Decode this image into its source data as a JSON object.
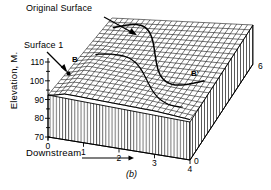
{
  "figure": {
    "caption": "(b)",
    "annotations": {
      "original_surface": "Original Surface",
      "surface_1": "Surface 1",
      "section_start": "B",
      "section_end": "B'"
    }
  },
  "axes": {
    "y": {
      "label": "Elevation, M.",
      "ticks": [
        "110",
        "100",
        "90",
        "80",
        "70"
      ],
      "min": 70,
      "max": 110
    },
    "x": {
      "label": "Downstream",
      "ticks": [
        "0",
        "1",
        "2",
        "3",
        "4"
      ],
      "min": 0,
      "max": 4
    },
    "z": {
      "ticks": [
        "0",
        "6"
      ],
      "min": 0,
      "max": 6
    }
  },
  "chart_data": {
    "type": "surface",
    "title": "",
    "xlabel": "Downstream",
    "ylabel": "Elevation, M.",
    "zlabel": "",
    "xlim": [
      0,
      4
    ],
    "ylim": [
      70,
      110
    ],
    "zlim": [
      0,
      6
    ],
    "grid": true,
    "legend_position": "none",
    "mesh": {
      "nx": 26,
      "nz": 20,
      "x_range": [
        0,
        4
      ],
      "z_range": [
        0,
        6
      ],
      "elevation_base": 70,
      "flat_plane_elevation": 103,
      "dune_amplitude": 6.5,
      "dune_wavelength_x": 1.1,
      "dune_wavelength_z": 1.6
    },
    "series": [
      {
        "name": "Original Surface",
        "kind": "plane",
        "elevation": 103
      },
      {
        "name": "Surface 1",
        "kind": "undulating-mesh",
        "elevation_min": 93,
        "elevation_max": 107
      }
    ],
    "section_line": {
      "name": "B-B'",
      "from": "B",
      "to": "B'"
    }
  }
}
